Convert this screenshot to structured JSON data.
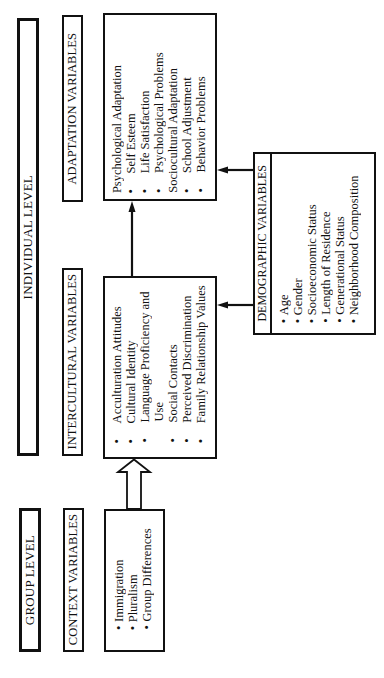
{
  "individual_level": {
    "title": "INDIVIDUAL LEVEL"
  },
  "group_level": {
    "title": "GROUP LEVEL"
  },
  "adaptation": {
    "label": "ADAPTATION VARIABLES",
    "items": [
      {
        "bullet": "",
        "text": "Psychological Adaptation",
        "indent": false
      },
      {
        "bullet": "•",
        "text": "Self Esteem",
        "indent": true
      },
      {
        "bullet": "•",
        "text": "Life Satisfaction",
        "indent": true
      },
      {
        "bullet": "•",
        "text": "Psychological Problems",
        "indent": true
      },
      {
        "bullet": "",
        "text": "Sociocultural Adaptation",
        "indent": false
      },
      {
        "bullet": "•",
        "text": "School Adjustment",
        "indent": true
      },
      {
        "bullet": "•",
        "text": "Behavior Problems",
        "indent": true
      }
    ]
  },
  "intercultural": {
    "label": "INTERCULTURAL VARIABLES",
    "items": [
      {
        "bullet": "•",
        "text": "Acculturation Attitudes"
      },
      {
        "bullet": "•",
        "text": "Cultural Identity"
      },
      {
        "bullet": "•",
        "text": "Language Proficiency and"
      },
      {
        "bullet": "",
        "text": "Use"
      },
      {
        "bullet": "•",
        "text": "Social Contacts"
      },
      {
        "bullet": "•",
        "text": "Perceived Discrimination"
      },
      {
        "bullet": "•",
        "text": "Family Relationship Values"
      }
    ]
  },
  "context": {
    "label": "CONTEXT VARIABLES",
    "items": [
      {
        "bullet": "•",
        "text": "Immigration"
      },
      {
        "bullet": "•",
        "text": "Pluralism"
      },
      {
        "bullet": "•",
        "text": "Group Differences"
      }
    ]
  },
  "demographic": {
    "label": "DEMOGRAPHIC VARIABLES",
    "items": [
      {
        "bullet": "•",
        "text": "Age"
      },
      {
        "bullet": "•",
        "text": "Gender"
      },
      {
        "bullet": "•",
        "text": "Socioeconomic Status"
      },
      {
        "bullet": "•",
        "text": "Length of Residence"
      },
      {
        "bullet": "•",
        "text": "Generational Status"
      },
      {
        "bullet": "•",
        "text": "Neighborhood Composition"
      }
    ]
  },
  "arrows": [
    {
      "from": "context",
      "to": "intercultural",
      "style": "hollow"
    },
    {
      "from": "intercultural",
      "to": "adaptation",
      "style": "solid"
    },
    {
      "from": "demographic",
      "to": "adaptation",
      "style": "solid"
    },
    {
      "from": "demographic",
      "to": "intercultural",
      "style": "solid"
    }
  ],
  "colors": {
    "line": "#111111",
    "background": "#ffffff"
  }
}
